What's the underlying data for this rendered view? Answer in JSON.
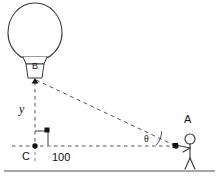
{
  "diagram": {
    "type": "right-triangle-trigonometry",
    "labels": {
      "balloon_basket": "B",
      "height_side": "y",
      "base_vertex": "C",
      "base_length": "100",
      "angle": "θ",
      "observer_vertex": "A"
    },
    "stroke_color": "#333333",
    "ground_color": "#8a8a8a",
    "marker_color": "#111111",
    "vertices": {
      "B": {
        "x": 35,
        "y": 79
      },
      "C": {
        "x": 35,
        "y": 146
      },
      "A": {
        "x": 176,
        "y": 146
      }
    },
    "elements": [
      {
        "name": "balloon-envelope",
        "shape": "ellipse"
      },
      {
        "name": "balloon-basket",
        "shape": "trapezoid"
      },
      {
        "name": "vertical-leg-BC",
        "style": "dashed"
      },
      {
        "name": "horizontal-leg-CA",
        "style": "dashed"
      },
      {
        "name": "hypotenuse-BA",
        "style": "dashed"
      },
      {
        "name": "right-angle-marker",
        "shape": "square"
      },
      {
        "name": "angle-arc",
        "shape": "arc"
      },
      {
        "name": "observer-figure",
        "shape": "stick-figure"
      },
      {
        "name": "ground-line",
        "style": "solid"
      }
    ]
  }
}
